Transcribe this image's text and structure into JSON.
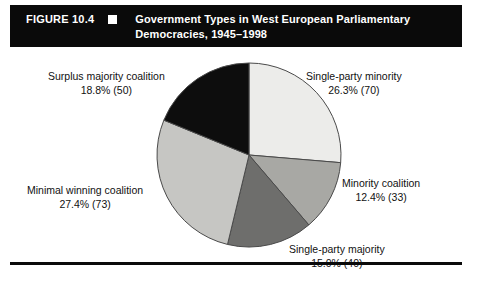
{
  "header": {
    "figure_number": "FIGURE 10.4",
    "bullet_icon": "square-bullet-icon",
    "title": "Government Types in West European Parliamentary Democracies, 1945–1998",
    "bar_color": "#0a0a0a",
    "text_color": "#ffffff"
  },
  "chart_data": {
    "type": "pie",
    "title": "Government Types in West European Parliamentary Democracies, 1945–1998",
    "xlabel": "",
    "ylabel": "",
    "legend_position": "none",
    "grid": false,
    "start_angle_deg": 0,
    "direction": "clockwise",
    "total_count": 266,
    "categories": [
      "Single-party minority",
      "Minority coalition",
      "Single-party majority",
      "Minimal winning coalition",
      "Surplus majority coalition"
    ],
    "values": [
      26.3,
      12.4,
      15.0,
      27.4,
      18.8
    ],
    "counts": [
      70,
      33,
      40,
      73,
      50
    ],
    "colors": [
      "#ececea",
      "#a8a8a4",
      "#6e6e6c",
      "#c6c6c3",
      "#0d0d0d"
    ],
    "slices": [
      {
        "name": "Single-party minority",
        "percent": 26.3,
        "count": 70,
        "color": "#ececea",
        "label_name": "Single-party minority",
        "label_value": "26.3% (70)"
      },
      {
        "name": "Minority coalition",
        "percent": 12.4,
        "count": 33,
        "color": "#a8a8a4",
        "label_name": "Minority coalition",
        "label_value": "12.4% (33)"
      },
      {
        "name": "Single-party majority",
        "percent": 15.0,
        "count": 40,
        "color": "#6e6e6c",
        "label_name": "Single-party majority",
        "label_value": "15.0% (40)"
      },
      {
        "name": "Minimal winning coalition",
        "percent": 27.4,
        "count": 73,
        "color": "#c6c6c3",
        "label_name": "Minimal winning coalition",
        "label_value": "27.4% (73)"
      },
      {
        "name": "Surplus majority coalition",
        "percent": 18.8,
        "count": 50,
        "color": "#0d0d0d",
        "label_name": "Surplus majority coalition",
        "label_value": "18.8% (50)"
      }
    ]
  },
  "pie_geometry": {
    "center_x": 249,
    "center_y": 155,
    "radius": 92,
    "stroke_color": "#4a4a4a"
  }
}
